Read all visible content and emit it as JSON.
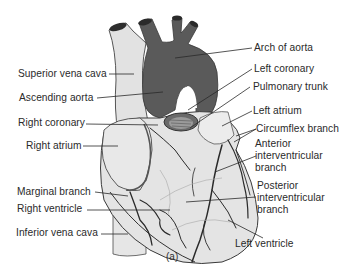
{
  "figure": {
    "caption": "(a)",
    "colors": {
      "aorta": "#5a5a5a",
      "heart_fill": "#e4e4e4",
      "vessel": "#2a2a2a",
      "outline": "#3a3a3a",
      "label_text": "#2a2a2a"
    }
  },
  "labels": {
    "left": [
      {
        "text": "Superior vena cava"
      },
      {
        "text": "Ascending aorta"
      },
      {
        "text": "Right coronary"
      },
      {
        "text": "Right atrium"
      },
      {
        "text": "Marginal branch"
      },
      {
        "text": "Right ventricle"
      },
      {
        "text": "Inferior vena cava"
      }
    ],
    "right": [
      {
        "text": "Arch of aorta"
      },
      {
        "text": "Left coronary"
      },
      {
        "text": "Pulmonary trunk"
      },
      {
        "text": "Left atrium"
      },
      {
        "text": "Circumflex branch"
      },
      {
        "text_lines": [
          "Anterior",
          "interventricular",
          "branch"
        ]
      },
      {
        "text_lines": [
          "Posterior",
          "interventricular",
          "branch"
        ]
      },
      {
        "text": "Left ventricle"
      }
    ]
  }
}
